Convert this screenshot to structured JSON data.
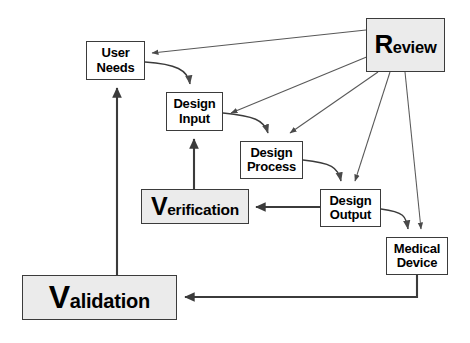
{
  "diagram": {
    "canvas": {
      "width": 470,
      "height": 343,
      "background": "#ffffff"
    },
    "style": {
      "node_border": "#3b3b3b",
      "node_fill_plain": "#ffffff",
      "node_fill_shaded": "#ebebeb",
      "edge_thin": "#555555",
      "edge_thick": "#3b3b3b",
      "text": "#000000"
    },
    "nodes": [
      {
        "id": "user-needs",
        "label": "User Needs",
        "line1": "User",
        "line2": "Needs",
        "fill": "plain",
        "x": 86,
        "y": 41,
        "w": 59,
        "h": 39
      },
      {
        "id": "design-input",
        "label": "Design Input",
        "line1": "Design",
        "line2": "Input",
        "fill": "plain",
        "x": 166,
        "y": 92,
        "w": 57,
        "h": 39
      },
      {
        "id": "design-process",
        "label": "Design Process",
        "line1": "Design",
        "line2": "Process",
        "fill": "plain",
        "x": 240,
        "y": 141,
        "w": 63,
        "h": 38
      },
      {
        "id": "design-output",
        "label": "Design Output",
        "line1": "Design",
        "line2": "Output",
        "fill": "plain",
        "x": 320,
        "y": 189,
        "w": 61,
        "h": 38
      },
      {
        "id": "medical-device",
        "label": "Medical Device",
        "line1": "Medical",
        "line2": "Device",
        "fill": "plain",
        "x": 386,
        "y": 237,
        "w": 62,
        "h": 38
      },
      {
        "id": "review",
        "label": "Review",
        "cap": "R",
        "rest": "eview",
        "fill": "shaded",
        "x": 366,
        "y": 18,
        "w": 79,
        "h": 54
      },
      {
        "id": "verification",
        "label": "Verification",
        "cap": "V",
        "rest": "erification",
        "fill": "shaded",
        "x": 141,
        "y": 189,
        "w": 108,
        "h": 35
      },
      {
        "id": "validation",
        "label": "Validation",
        "cap": "V",
        "rest": "alidation",
        "fill": "shaded",
        "x": 22,
        "y": 275,
        "w": 155,
        "h": 45
      }
    ],
    "edges": [
      {
        "id": "review-to-user-needs",
        "from": "review",
        "to": "user-needs",
        "kind": "thin-straight",
        "label": ""
      },
      {
        "id": "review-to-design-input",
        "from": "review",
        "to": "design-input",
        "kind": "thin-straight",
        "label": ""
      },
      {
        "id": "review-to-design-process",
        "from": "review",
        "to": "design-process",
        "kind": "thin-straight",
        "label": ""
      },
      {
        "id": "review-to-design-output",
        "from": "review",
        "to": "design-output",
        "kind": "thin-straight",
        "label": ""
      },
      {
        "id": "review-to-medical-device",
        "from": "review",
        "to": "medical-device",
        "kind": "thin-straight",
        "label": ""
      },
      {
        "id": "user-needs-to-design-input",
        "from": "user-needs",
        "to": "design-input",
        "kind": "curve",
        "label": ""
      },
      {
        "id": "design-input-to-design-process",
        "from": "design-input",
        "to": "design-process",
        "kind": "curve",
        "label": ""
      },
      {
        "id": "design-process-to-design-output",
        "from": "design-process",
        "to": "design-output",
        "kind": "curve",
        "label": ""
      },
      {
        "id": "design-output-to-medical-device",
        "from": "design-output",
        "to": "medical-device",
        "kind": "curve",
        "label": ""
      },
      {
        "id": "design-output-to-verification",
        "from": "design-output",
        "to": "verification",
        "kind": "thick-straight",
        "label": ""
      },
      {
        "id": "verification-to-design-input",
        "from": "verification",
        "to": "design-input",
        "kind": "thick-straight",
        "label": ""
      },
      {
        "id": "medical-device-to-validation",
        "from": "medical-device",
        "to": "validation",
        "kind": "thick-elbow",
        "label": ""
      },
      {
        "id": "validation-to-user-needs",
        "from": "validation",
        "to": "user-needs",
        "kind": "thick-straight",
        "label": ""
      }
    ]
  }
}
